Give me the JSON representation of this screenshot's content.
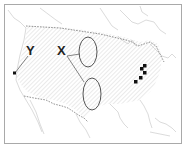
{
  "map": {
    "subject": "United States with Canada and Mexico borders",
    "labels": {
      "x": "X",
      "y": "Y"
    },
    "markers": {
      "point_y": {
        "description": "dot on west coast",
        "color": "#111111"
      },
      "ellipses": [
        {
          "id": "upper-ellipse",
          "description": "ellipse over northern Great Plains",
          "stroke": "#555555"
        },
        {
          "id": "lower-ellipse",
          "description": "ellipse over central/southern Great Plains",
          "stroke": "#555555"
        }
      ],
      "squares": {
        "count": 5,
        "description": "black squares in Ohio Valley / Great Lakes region",
        "color": "#111111"
      }
    },
    "colors": {
      "frame": "#a9a9a9",
      "coastline": "#c8c8c8",
      "border_dashed": "#666666",
      "hatch": "#cfcfcf",
      "leader_line": "#777777"
    }
  }
}
